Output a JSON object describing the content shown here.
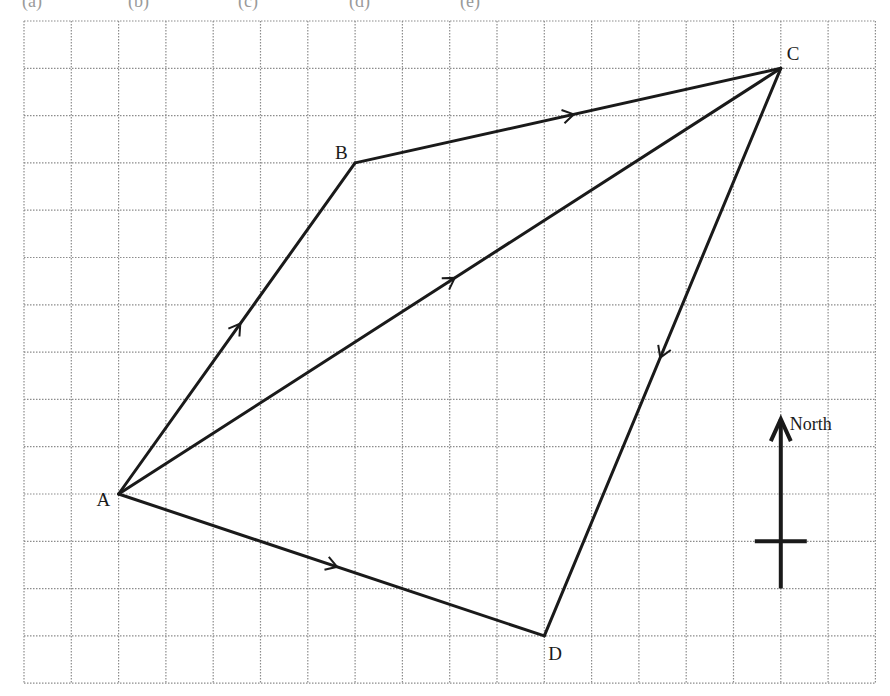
{
  "header": {
    "cropped_labels": [
      {
        "text": "(a)",
        "x": 22
      },
      {
        "text": "(b)",
        "x": 128
      },
      {
        "text": "(c)",
        "x": 238
      },
      {
        "text": "(d)",
        "x": 349
      },
      {
        "text": "(e)",
        "x": 460
      }
    ]
  },
  "grid": {
    "left": 24,
    "top": 21,
    "cell": 47.3,
    "columns": 18,
    "rows": 14,
    "line_color": "#8c8c8c"
  },
  "points": {
    "A": {
      "label": "A",
      "gx": 2,
      "gy": 10
    },
    "B": {
      "label": "B",
      "gx": 7,
      "gy": 3
    },
    "C": {
      "label": "C",
      "gx": 16,
      "gy": 1
    },
    "D": {
      "label": "D",
      "gx": 11,
      "gy": 13
    }
  },
  "vectors": [
    {
      "from": "A",
      "to": "B",
      "arrow": "forward"
    },
    {
      "from": "B",
      "to": "C",
      "arrow": "forward"
    },
    {
      "from": "A",
      "to": "C",
      "arrow": "forward"
    },
    {
      "from": "C",
      "to": "D",
      "arrow": "forward"
    },
    {
      "from": "A",
      "to": "D",
      "arrow": "forward"
    }
  ],
  "compass": {
    "label": "North",
    "gx": 16,
    "top_gy": 8.5,
    "bottom_gy": 12,
    "crossbar_gy": 11,
    "crossbar_half_width": 26
  },
  "colors": {
    "line": "#1a1a1a",
    "background": "#ffffff"
  }
}
